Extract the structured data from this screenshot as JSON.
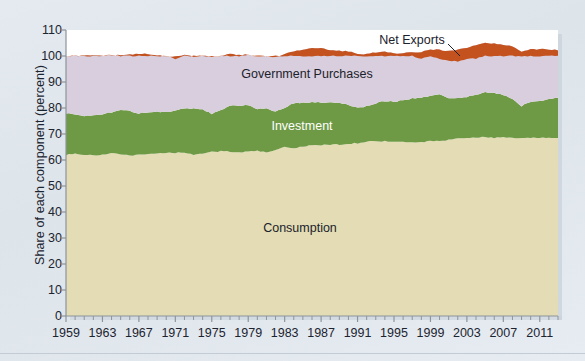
{
  "chart": {
    "type": "area",
    "axis_label_y": "Share of each component (percent)",
    "axis_label_x": "",
    "plot_background": "#ffffff",
    "figure_background": "#dde4ea"
  },
  "chart_data": {
    "type": "area",
    "stacked": true,
    "title": "",
    "xlabel": "",
    "ylabel": "Share of each component (percent)",
    "ylim": [
      0,
      110
    ],
    "yticks": [
      0,
      10,
      20,
      30,
      40,
      50,
      60,
      70,
      80,
      90,
      100,
      110
    ],
    "xlim": [
      1959,
      2013
    ],
    "xticks": [
      1959,
      1963,
      1967,
      1971,
      1975,
      1979,
      1983,
      1987,
      1991,
      1995,
      1999,
      2003,
      2007,
      2011
    ],
    "minor_xticks_every": 1,
    "grid": false,
    "legend_position": "inline-labels",
    "x": [
      1959,
      1960,
      1961,
      1962,
      1963,
      1964,
      1965,
      1966,
      1967,
      1968,
      1969,
      1970,
      1971,
      1972,
      1973,
      1974,
      1975,
      1976,
      1977,
      1978,
      1979,
      1980,
      1981,
      1982,
      1983,
      1984,
      1985,
      1986,
      1987,
      1988,
      1989,
      1990,
      1991,
      1992,
      1993,
      1994,
      1995,
      1996,
      1997,
      1998,
      1999,
      2000,
      2001,
      2002,
      2003,
      2004,
      2005,
      2006,
      2007,
      2008,
      2009,
      2010,
      2011,
      2012,
      2013
    ],
    "series": [
      {
        "name": "Consumption",
        "color": "#e3dcb4",
        "label_color": "#1b222c",
        "values": [
          62.0,
          62.3,
          62.0,
          61.8,
          62.0,
          62.5,
          62.3,
          61.8,
          62.0,
          62.3,
          62.3,
          62.8,
          62.8,
          62.8,
          62.0,
          62.5,
          63.3,
          63.3,
          63.2,
          63.0,
          63.2,
          63.5,
          62.8,
          64.0,
          65.0,
          64.3,
          65.2,
          65.8,
          65.8,
          66.0,
          66.0,
          66.3,
          66.5,
          67.0,
          67.3,
          67.2,
          67.0,
          67.0,
          66.8,
          66.8,
          67.3,
          67.3,
          67.8,
          68.3,
          68.5,
          68.5,
          68.8,
          68.5,
          68.8,
          68.5,
          68.3,
          68.5,
          68.5,
          68.5,
          68.3
        ]
      },
      {
        "name": "Investment",
        "color": "#6e9a45",
        "label_color": "#ffffff",
        "values": [
          16.0,
          15.0,
          14.8,
          15.3,
          15.5,
          15.8,
          17.0,
          17.0,
          16.0,
          16.0,
          16.3,
          15.5,
          16.0,
          17.0,
          17.8,
          16.8,
          14.5,
          16.0,
          17.5,
          18.0,
          18.0,
          16.0,
          17.0,
          14.5,
          15.0,
          17.5,
          16.8,
          16.5,
          16.3,
          16.0,
          16.0,
          15.0,
          13.5,
          13.8,
          14.5,
          15.5,
          15.5,
          16.0,
          16.8,
          17.3,
          17.5,
          17.8,
          16.0,
          15.5,
          15.8,
          16.5,
          17.3,
          17.3,
          16.3,
          14.8,
          12.5,
          13.8,
          14.3,
          15.0,
          15.5
        ]
      },
      {
        "name": "Government Purchases",
        "color": "#d9cedd",
        "label_color": "#1b222c",
        "values": [
          22.0,
          22.8,
          23.3,
          23.3,
          22.8,
          22.0,
          21.0,
          21.8,
          22.8,
          22.5,
          21.8,
          21.5,
          21.0,
          20.5,
          20.0,
          20.8,
          21.8,
          20.8,
          20.0,
          19.5,
          19.3,
          20.3,
          20.0,
          21.0,
          20.8,
          20.0,
          20.5,
          20.8,
          20.8,
          20.3,
          20.0,
          20.5,
          20.8,
          20.0,
          19.5,
          18.8,
          18.5,
          18.0,
          17.8,
          17.5,
          17.5,
          17.3,
          18.0,
          18.8,
          19.0,
          19.0,
          19.0,
          19.0,
          19.3,
          20.3,
          21.0,
          20.3,
          19.8,
          19.0,
          18.5
        ]
      },
      {
        "name": "Net Exports",
        "color": "#c4521f",
        "label_color": "#1b222c",
        "values": [
          0.0,
          -0.1,
          -0.1,
          -0.4,
          -0.3,
          0.3,
          -0.3,
          -0.6,
          -0.8,
          -0.8,
          -0.4,
          0.2,
          -0.8,
          -0.3,
          0.2,
          -0.1,
          0.4,
          -0.1,
          -0.7,
          -0.5,
          0.0,
          0.2,
          0.2,
          0.5,
          -0.8,
          -1.8,
          -2.5,
          -3.1,
          -2.9,
          -2.3,
          -2.0,
          -1.8,
          -0.8,
          -1.0,
          -1.3,
          -1.5,
          -1.0,
          -1.2,
          -1.4,
          -2.6,
          -2.3,
          -3.4,
          -3.8,
          -4.6,
          -4.3,
          -5.0,
          -5.1,
          -4.8,
          -4.4,
          -3.6,
          -1.8,
          -2.6,
          -2.6,
          -2.5,
          -2.3
        ]
      }
    ],
    "annotations": [
      {
        "text": "Net Exports",
        "x_px": 412,
        "y_px": 40,
        "leader_to_x_px": 460,
        "leader_to_y_px": 56
      },
      {
        "text": "Government Purchases",
        "x_px": 307,
        "y_px": 74
      },
      {
        "text": "Investment",
        "x_px": 302,
        "y_px": 126
      },
      {
        "text": "Consumption",
        "x_px": 300,
        "y_px": 228
      }
    ]
  }
}
